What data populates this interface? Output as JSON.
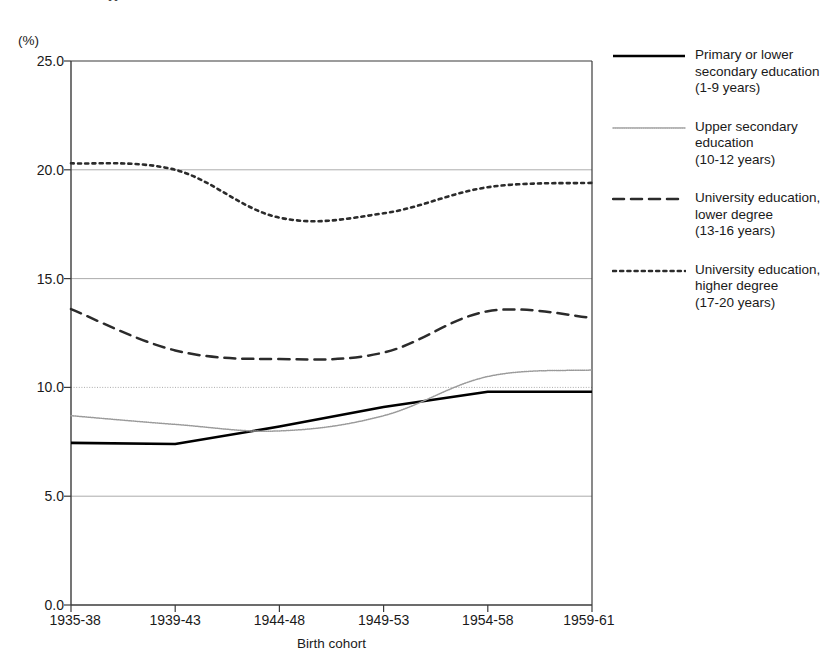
{
  "figure": {
    "title_remnant": "g",
    "unit_label": "(%)",
    "xaxis_title": "Birth cohort"
  },
  "chart_data": {
    "type": "line",
    "title": "",
    "xlabel": "Birth cohort",
    "ylabel": "(%)",
    "ylim": [
      0.0,
      25.0
    ],
    "yticks": [
      "0.0",
      "5.0",
      "10.0",
      "15.0",
      "20.0",
      "25.0"
    ],
    "ytick_values": [
      0.0,
      5.0,
      10.0,
      15.0,
      20.0,
      25.0
    ],
    "grid": "horizontal",
    "legend_position": "right",
    "categories": [
      "1935-38",
      "1939-43",
      "1944-48",
      "1949-53",
      "1954-58",
      "1959-61"
    ],
    "series": [
      {
        "name": "Primary or lower secondary education (1-9 years)",
        "legend_label": "Primary or lower\nsecondary education\n(1-9 years)",
        "style": "solid",
        "color": "#000000",
        "values": [
          7.45,
          7.4,
          8.2,
          9.1,
          9.8,
          9.8
        ]
      },
      {
        "name": "Upper secondary education (10-12 years)",
        "legend_label": "Upper secondary\neducation\n(10-12 years)",
        "style": "fine-dotted",
        "color": "#9a9a9a",
        "values": [
          8.7,
          8.3,
          8.0,
          8.7,
          10.5,
          10.8
        ]
      },
      {
        "name": "University education, lower degree (13-16 years)",
        "legend_label": "University education,\nlower degree\n(13-16 years)",
        "style": "dashed",
        "color": "#2b2b2b",
        "values": [
          13.6,
          11.7,
          11.3,
          11.6,
          13.5,
          13.2
        ]
      },
      {
        "name": "University education, higher degree (17-20 years)",
        "legend_label": "University education,\nhigher degree\n(17-20 years)",
        "style": "dotted",
        "color": "#2b2b2b",
        "values": [
          20.3,
          20.0,
          17.8,
          18.0,
          19.2,
          19.4
        ]
      }
    ]
  }
}
